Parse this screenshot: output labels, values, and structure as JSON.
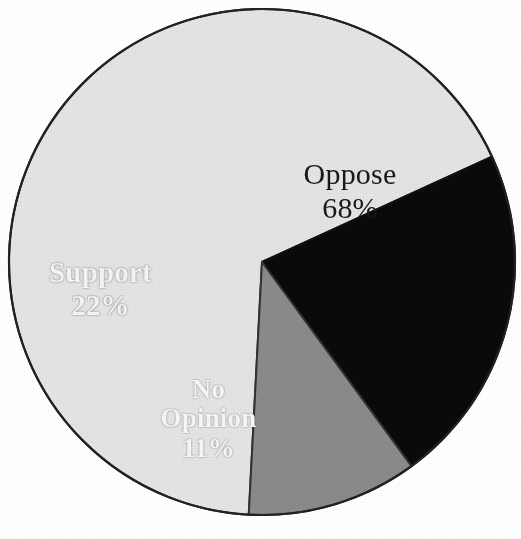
{
  "chart_data": {
    "type": "pie",
    "title": "",
    "subtitle": "",
    "xlabel": "",
    "ylabel": "",
    "legend_position": "none",
    "grid": false,
    "labels_inside_slices": true,
    "categories": [
      "Oppose",
      "Support",
      "No Opinion"
    ],
    "values": [
      68,
      22,
      11
    ],
    "value_unit": "%",
    "slices": [
      {
        "name": "Oppose",
        "label": "Oppose",
        "value": 68,
        "value_text": "68%",
        "color": "#e4e4e4",
        "text_color": "#191919",
        "start_angle_deg": 183,
        "end_angle_deg": 427
      },
      {
        "name": "Support",
        "label": "Support",
        "value": 22,
        "value_text": "22%",
        "color": "#0a0a0a",
        "text_color": "#f2f2f2",
        "start_angle_deg": 128,
        "end_angle_deg": 207
      },
      {
        "name": "No Opinion",
        "label_line_1": "No",
        "label_line_2": "Opinion",
        "value": 11,
        "value_text": "11%",
        "color": "#8a8a8a",
        "text_color": "#f4f4f4",
        "start_angle_deg": 183,
        "end_angle_deg": 222
      }
    ],
    "geometry": {
      "center_x": 262,
      "center_y": 262,
      "radius": 253,
      "outline_color": "#222222",
      "outline_width": 2
    },
    "background_color": "#ffffff"
  }
}
